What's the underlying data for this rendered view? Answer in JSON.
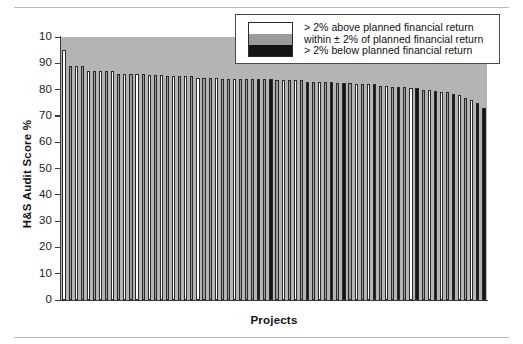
{
  "figure": {
    "background_color": "#ffffff",
    "plot_background_color": "#b4b4b4"
  },
  "legend": {
    "position": "top-right",
    "entries": [
      {
        "key": "above",
        "label": "> 2% above planned financial return",
        "color": "#ffffff"
      },
      {
        "key": "within",
        "label": "within ± 2% of planned financial return",
        "color": "#9a9a9a"
      },
      {
        "key": "below",
        "label": "> 2% below planned financial return",
        "color": "#141414"
      }
    ]
  },
  "chart_data": {
    "type": "bar",
    "title": "",
    "xlabel": "Projects",
    "ylabel": "H&S Audit Score %",
    "ylim": [
      0,
      100
    ],
    "ytick_labels": [
      "10",
      "90",
      "80",
      "70",
      "60",
      "50",
      "40",
      "30",
      "20",
      "10",
      "0"
    ],
    "ytick_values": [
      100,
      90,
      80,
      70,
      60,
      50,
      40,
      30,
      20,
      10,
      0
    ],
    "grid": false,
    "xtick_labels": [],
    "categories": [
      "P1",
      "P2",
      "P3",
      "P4",
      "P5",
      "P6",
      "P7",
      "P8",
      "P9",
      "P10",
      "P11",
      "P12",
      "P13",
      "P14",
      "P15",
      "P16",
      "P17",
      "P18",
      "P19",
      "P20",
      "P21",
      "P22",
      "P23",
      "P24",
      "P25",
      "P26",
      "P27",
      "P28",
      "P29",
      "P30",
      "P31",
      "P32",
      "P33",
      "P34",
      "P35",
      "P36",
      "P37",
      "P38",
      "P39",
      "P40",
      "P41",
      "P42",
      "P43",
      "P44",
      "P45",
      "P46",
      "P47",
      "P48",
      "P49",
      "P50",
      "P51",
      "P52",
      "P53",
      "P54",
      "P55",
      "P56",
      "P57",
      "P58",
      "P59",
      "P60",
      "P61",
      "P62",
      "P63",
      "P64",
      "P65",
      "P66",
      "P67",
      "P68",
      "P69",
      "P70"
    ],
    "values": [
      95,
      89,
      89,
      89,
      87,
      87,
      87,
      87,
      87,
      86,
      86,
      86,
      86,
      86,
      85.5,
      85.5,
      85.5,
      85,
      85,
      85,
      85,
      85,
      84.5,
      84.5,
      84.5,
      84.5,
      84,
      84,
      84,
      84,
      84,
      84,
      84,
      84,
      84,
      83.5,
      83.5,
      83.5,
      83.5,
      83.5,
      83,
      83,
      83,
      83,
      83,
      82.5,
      82.5,
      82.5,
      82,
      82,
      82,
      82,
      81.5,
      81.5,
      81,
      81,
      81,
      80.5,
      80.5,
      80,
      80,
      79.5,
      79,
      79,
      78.5,
      78,
      77,
      76,
      75,
      73
    ],
    "categories_color_key": [
      "above",
      "above",
      "within",
      "above",
      "above",
      "within",
      "above",
      "within",
      "above",
      "above",
      "within",
      "above",
      "within",
      "above",
      "within",
      "above",
      "within",
      "above",
      "within",
      "above",
      "within",
      "within",
      "above",
      "within",
      "below",
      "within",
      "above",
      "within",
      "below",
      "within",
      "above",
      "within",
      "below",
      "above",
      "within",
      "below",
      "within",
      "above",
      "within",
      "below",
      "within",
      "above",
      "below",
      "within",
      "above",
      "below",
      "within",
      "above",
      "below",
      "within",
      "above",
      "below",
      "within",
      "above",
      "below",
      "within",
      "above",
      "below",
      "within",
      "above",
      "below",
      "within",
      "above",
      "below",
      "above",
      "below",
      "white-short",
      "above",
      "below",
      "below"
    ],
    "series": [
      {
        "name": "> 2% above planned financial return",
        "color": "#ffffff"
      },
      {
        "name": "within ± 2% of planned financial return",
        "color": "#9a9a9a"
      },
      {
        "name": "> 2% below planned financial return",
        "color": "#141414"
      }
    ],
    "bar_colors": [
      "above",
      "within",
      "above",
      "within",
      "above",
      "within",
      "above",
      "within",
      "above",
      "within",
      "above",
      "within",
      "above",
      "within",
      "above",
      "within",
      "above",
      "within",
      "above",
      "within",
      "above",
      "within",
      "above",
      "within",
      "within",
      "above",
      "within",
      "within",
      "above",
      "within",
      "within",
      "within",
      "below",
      "within",
      "below",
      "within",
      "above",
      "within",
      "above",
      "within",
      "below",
      "within",
      "above",
      "within",
      "below",
      "within",
      "below",
      "within",
      "above",
      "within",
      "above",
      "below",
      "within",
      "above",
      "within",
      "below",
      "within",
      "above",
      "below",
      "within",
      "above",
      "below",
      "above",
      "within",
      "below",
      "above",
      "within",
      "above",
      "below",
      "below"
    ]
  }
}
